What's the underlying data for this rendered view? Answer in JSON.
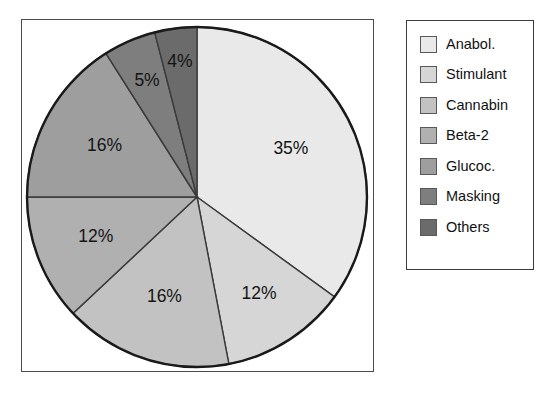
{
  "chart_data": {
    "type": "pie",
    "title": "",
    "categories": [
      "Anabol.",
      "Stimulant",
      "Cannabin",
      "Beta-2",
      "Glucoc.",
      "Masking",
      "Others"
    ],
    "values": [
      35,
      12,
      16,
      12,
      16,
      5,
      4
    ],
    "value_labels": [
      "35%",
      "12%",
      "16%",
      "12%",
      "16%",
      "5%",
      "4%"
    ],
    "colors": [
      "#e9e9e9",
      "#d6d6d6",
      "#c2c2c2",
      "#b0b0b0",
      "#9e9e9e",
      "#7e7e7e",
      "#6b6b6b"
    ],
    "start_angle_deg": 0,
    "direction": "clockwise",
    "legend_position": "right",
    "grid": false,
    "xlabel": "",
    "ylabel": ""
  },
  "figure": {
    "frame_stroke": "#4a4a4a",
    "pie_outline": "#1a1a1a",
    "slice_divider": "#3a3a3a",
    "background": "#ffffff"
  },
  "legend": {
    "entries": [
      {
        "label": "Anabol.",
        "color": "#e9e9e9"
      },
      {
        "label": "Stimulant",
        "color": "#d6d6d6"
      },
      {
        "label": "Cannabin",
        "color": "#c2c2c2"
      },
      {
        "label": "Beta-2",
        "color": "#b0b0b0"
      },
      {
        "label": "Glucoc.",
        "color": "#9e9e9e"
      },
      {
        "label": "Masking",
        "color": "#7e7e7e"
      },
      {
        "label": "Others",
        "color": "#6b6b6b"
      }
    ]
  }
}
